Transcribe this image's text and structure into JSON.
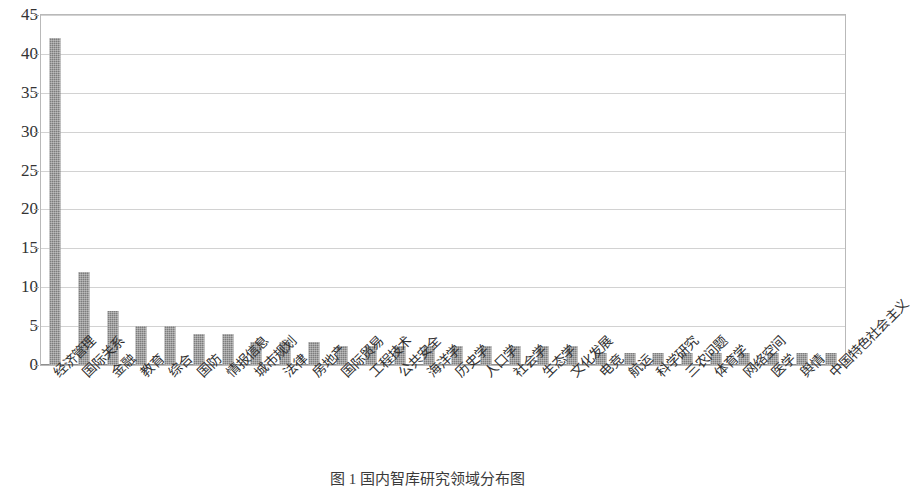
{
  "chart_data": {
    "type": "bar",
    "title": "",
    "xlabel": "",
    "ylabel": "",
    "ylim": [
      0,
      45
    ],
    "yticks": [
      0,
      5,
      10,
      15,
      20,
      25,
      30,
      35,
      40,
      45
    ],
    "ytick_labels": [
      "0",
      "5",
      "10",
      "15",
      "20",
      "25",
      "30",
      "35",
      "40",
      "45"
    ],
    "grid": true,
    "legend": "none",
    "bar_color": "#7d7d7d",
    "categories": [
      "经济管理",
      "国际关系",
      "金融",
      "教育",
      "综合",
      "国防",
      "情报信息",
      "城市规划",
      "法律",
      "房地产",
      "国际贸易",
      "工程技术",
      "公共安全",
      "海洋学",
      "历史学",
      "人口学",
      "社会学",
      "生态学",
      "文化发展",
      "电竞",
      "航运",
      "科学研究",
      "三农问题",
      "体育学",
      "网络空间",
      "医学",
      "舆情",
      "中国特色社会主义"
    ],
    "values": [
      42,
      12,
      7,
      5,
      5,
      4,
      4,
      3,
      3,
      3,
      2.5,
      2.5,
      2.5,
      2.5,
      2.5,
      2.5,
      2.5,
      2.5,
      2.5,
      1.5,
      1.5,
      1.5,
      1.5,
      1.5,
      1.5,
      1.5,
      1.5,
      1.5
    ]
  },
  "caption": {
    "text": "图 1  国内智库研究领域分布图"
  }
}
